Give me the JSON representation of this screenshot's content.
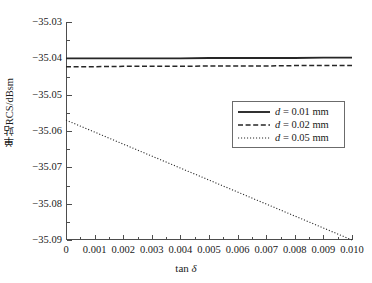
{
  "chart_data": {
    "type": "line",
    "title": "",
    "xlabel": "tan δ",
    "ylabel": "单站RCS/dBsm",
    "xlim": [
      0,
      0.01
    ],
    "ylim": [
      -35.09,
      -35.03
    ],
    "grid": false,
    "legend_position": "center-right",
    "xticks": [
      0,
      0.001,
      0.002,
      0.003,
      0.004,
      0.005,
      0.006,
      0.007,
      0.008,
      0.009,
      0.01
    ],
    "xtick_labels": [
      "0",
      "0.001",
      "0.002",
      "0.003",
      "0.004",
      "0.005",
      "0.006",
      "0.007",
      "0.008",
      "0.009",
      "0.010"
    ],
    "yticks": [
      -35.03,
      -35.04,
      -35.05,
      -35.06,
      -35.07,
      -35.08,
      -35.09
    ],
    "ytick_labels": [
      "−35.03",
      "−35.04",
      "−35.05",
      "−35.06",
      "−35.07",
      "−35.08",
      "−35.09"
    ],
    "x": [
      0,
      0.001,
      0.002,
      0.003,
      0.004,
      0.005,
      0.006,
      0.007,
      0.008,
      0.009,
      0.01
    ],
    "series": [
      {
        "name": "d = 0.01 mm",
        "style": "solid",
        "color": "#262626",
        "values": [
          -35.04,
          -35.04,
          -35.04,
          -35.04,
          -35.04,
          -35.0399,
          -35.0399,
          -35.0399,
          -35.0399,
          -35.0398,
          -35.0398
        ]
      },
      {
        "name": "d = 0.02 mm",
        "style": "dashed",
        "color": "#262626",
        "values": [
          -35.0423,
          -35.0423,
          -35.0422,
          -35.0422,
          -35.0422,
          -35.0421,
          -35.0421,
          -35.0421,
          -35.042,
          -35.042,
          -35.042
        ]
      },
      {
        "name": "d = 0.05 mm",
        "style": "dotted",
        "color": "#262626",
        "values": [
          -35.057,
          -35.0603,
          -35.0636,
          -35.0669,
          -35.0702,
          -35.0735,
          -35.0768,
          -35.0801,
          -35.0834,
          -35.0867,
          -35.09
        ]
      }
    ]
  },
  "legend": {
    "items": [
      {
        "label_prefix": "d",
        "label_rest": " = 0.01 mm",
        "style": "solid"
      },
      {
        "label_prefix": "d",
        "label_rest": " = 0.02 mm",
        "style": "dashed"
      },
      {
        "label_prefix": "d",
        "label_rest": " = 0.05 mm",
        "style": "dotted"
      }
    ]
  },
  "axis_titles": {
    "x_prefix": "tan ",
    "x_symbol": "δ",
    "y": "单站RCS/dBsm"
  }
}
